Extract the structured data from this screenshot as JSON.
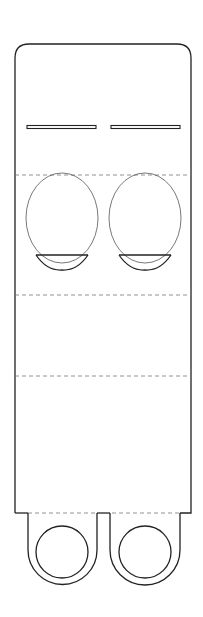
{
  "diagram": {
    "title": "",
    "colors": {
      "background": "#ffffff",
      "cut_line": "#222222",
      "fold_line": "#777777",
      "guide_line": "#555555"
    },
    "elements": {
      "body": "outer-panel",
      "slots": [
        "left-slot",
        "right-slot"
      ],
      "cutouts": [
        "left-eye-cutout",
        "right-eye-cutout"
      ],
      "fold_lines": [
        "fold-line-1",
        "fold-line-2",
        "fold-line-3",
        "tab-fold-line"
      ],
      "tabs": [
        "left-loop-tab",
        "right-loop-tab"
      ],
      "holes": [
        "left-tab-hole",
        "right-tab-hole"
      ]
    }
  }
}
